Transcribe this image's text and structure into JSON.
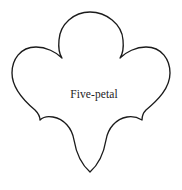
{
  "figure": {
    "name": "five-petal-flower-outline",
    "label": "Five-petal",
    "petal_count": 5,
    "stroke_color": "#1b1b1b",
    "fill_color": "#ffffff",
    "background_color": "#ffffff",
    "stroke_width": 1.35,
    "canvas": {
      "width": 182,
      "height": 190
    },
    "geometry": {
      "center_x": 90,
      "center_y": 96,
      "top_apex_y": 12,
      "bottom_extent_y": 178,
      "left_extent_x": 12,
      "right_extent_x": 170,
      "cusps": [
        {
          "name": "upper-left-cusp",
          "x": 62,
          "y": 58
        },
        {
          "name": "upper-right-cusp",
          "x": 120,
          "y": 58
        },
        {
          "name": "lower-right-cusp",
          "x": 142,
          "y": 120
        },
        {
          "name": "bottom-cusp",
          "x": 90,
          "y": 172
        },
        {
          "name": "lower-left-cusp",
          "x": 40,
          "y": 120
        }
      ],
      "path": "M 90 12 C 106 12 122 24 123 40 C 124 50 122 55 120 58 C 126 52 136 47 146 47 C 162 47 170 60 170 73 C 170 88 158 100 146 110 C 143 113 142 117 142 120 C 137 117 132 116 127 117 C 116 119 108 128 106 140 C 104 152 99 164 90 172 C 81 164 76 152 74 140 C 72 128 64 119 53 117 C 48 116 43 117 40 120 C 40 117 38 113 35 110 C 23 100 12 88 12 73 C 12 60 20 47 36 47 C 46 47 56 52 62 58 C 60 55 58 50 59 40 C 60 24 74 12 90 12 Z"
    }
  }
}
